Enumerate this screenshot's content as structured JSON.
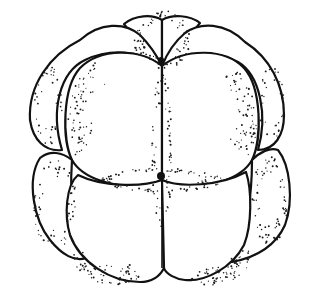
{
  "figure": {
    "subject": "stippled line drawing of a cleavage-stage embryo (16-cell stage)",
    "style": "black ink outline with stipple shading on white",
    "colors": {
      "background": "#ffffff",
      "ink": "#111111"
    },
    "blastomeres": [
      {
        "id": "top-left-small",
        "position": "top"
      },
      {
        "id": "top-right-small",
        "position": "top"
      },
      {
        "id": "upper-left-outer",
        "position": "upper-left"
      },
      {
        "id": "upper-right-outer",
        "position": "upper-right"
      },
      {
        "id": "upper-front-left",
        "position": "upper-center-left"
      },
      {
        "id": "upper-front-right",
        "position": "upper-center-right"
      },
      {
        "id": "lower-left-outer",
        "position": "lower-left"
      },
      {
        "id": "lower-right-outer",
        "position": "lower-right"
      },
      {
        "id": "lower-front-left",
        "position": "lower-center-left"
      },
      {
        "id": "lower-front-right",
        "position": "lower-center-right"
      }
    ]
  }
}
